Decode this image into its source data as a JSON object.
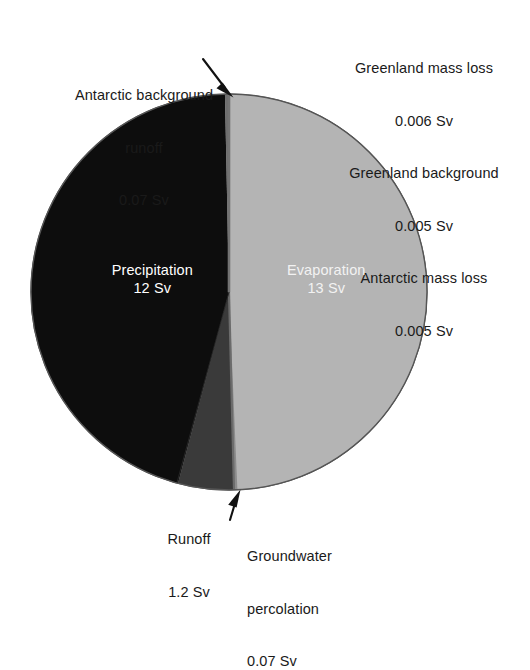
{
  "figure": {
    "background": "#ffffff",
    "width": 530,
    "height": 591
  },
  "chart_data": {
    "type": "pie",
    "title": "",
    "subtitle": "",
    "xlabel": "",
    "ylabel": "",
    "unit": "Sv",
    "legend_position": "none",
    "grid": false,
    "total": 26.286,
    "center": {
      "x": 229,
      "y": 292
    },
    "radius": 198,
    "start_angle_deg": -90,
    "direction": "clockwise",
    "categories": [
      "Evaporation",
      "Groundwater percolation",
      "Runoff",
      "Precipitation",
      "Antarctic background runoff",
      "Greenland mass loss",
      "Greenland background",
      "Antarctic mass loss"
    ],
    "values": [
      13,
      0.07,
      1.2,
      12,
      0.07,
      0.006,
      0.005,
      0.005
    ],
    "slices": [
      {
        "name": "Evaporation",
        "label": "Evaporation",
        "value": 13,
        "value_text": "13 Sv",
        "color": "#b4b4b4",
        "text_color": "#f2f2f2",
        "label_placement": "inside"
      },
      {
        "name": "Groundwater percolation",
        "label": "Groundwater percolation",
        "value": 0.07,
        "value_text": "0.07 Sv",
        "color": "#8c8c8c",
        "text_color": "#1a1a1a",
        "label_placement": "callout-bottom-right"
      },
      {
        "name": "Runoff",
        "label": "Runoff",
        "value": 1.2,
        "value_text": "1.2 Sv",
        "color": "#3a3a3a",
        "text_color": "#1a1a1a",
        "label_placement": "callout-bottom-left"
      },
      {
        "name": "Precipitation",
        "label": "Precipitation",
        "value": 12,
        "value_text": "12 Sv",
        "color": "#0d0d0d",
        "text_color": "#ffffff",
        "label_placement": "inside"
      },
      {
        "name": "Antarctic background runoff",
        "label": "Antarctic background runoff",
        "value": 0.07,
        "value_text": "0.07 Sv",
        "color": "#6e6e6e",
        "text_color": "#1a1a1a",
        "label_placement": "callout-top-left"
      },
      {
        "name": "Greenland mass loss",
        "label": "Greenland mass loss",
        "value": 0.006,
        "value_text": "0.006 Sv",
        "color": "#9a9a9a",
        "text_color": "#1a1a1a",
        "label_placement": "stack-top-right"
      },
      {
        "name": "Greenland background",
        "label": "Greenland background",
        "value": 0.005,
        "value_text": "0.005 Sv",
        "color": "#9a9a9a",
        "text_color": "#1a1a1a",
        "label_placement": "stack-top-right"
      },
      {
        "name": "Antarctic mass loss",
        "label": "Antarctic mass loss",
        "value": 0.005,
        "value_text": "0.005 Sv",
        "color": "#9a9a9a",
        "text_color": "#1a1a1a",
        "label_placement": "stack-top-right"
      }
    ],
    "annotations": [
      {
        "name": "antarctic-background-runoff-arrow",
        "from": {
          "x": 206,
          "y": 62
        },
        "to": {
          "x": 232,
          "y": 96
        },
        "style": "solid-arrow"
      },
      {
        "name": "groundwater-percolation-arrow",
        "from": {
          "x": 233,
          "y": 523
        },
        "to": {
          "x": 240,
          "y": 491
        },
        "style": "solid-arrow"
      }
    ]
  },
  "labels": {
    "antarctic_background_runoff": {
      "line1": "Antarctic background",
      "line2": "runoff",
      "line3": "0.07 Sv"
    },
    "right_stack": {
      "line1": "Greenland mass loss",
      "line2": "0.006 Sv",
      "line3": "Greenland background",
      "line4": "0.005 Sv",
      "line5": "Antarctic mass loss",
      "line6": "0.005 Sv"
    },
    "precipitation": {
      "line1": "Precipitation",
      "line2": "12 Sv"
    },
    "evaporation": {
      "line1": "Evaporation",
      "line2": "13 Sv"
    },
    "runoff": {
      "line1": "Runoff",
      "line2": "1.2 Sv"
    },
    "groundwater": {
      "line1": "Groundwater",
      "line2": "percolation",
      "line3": "0.07 Sv"
    }
  }
}
